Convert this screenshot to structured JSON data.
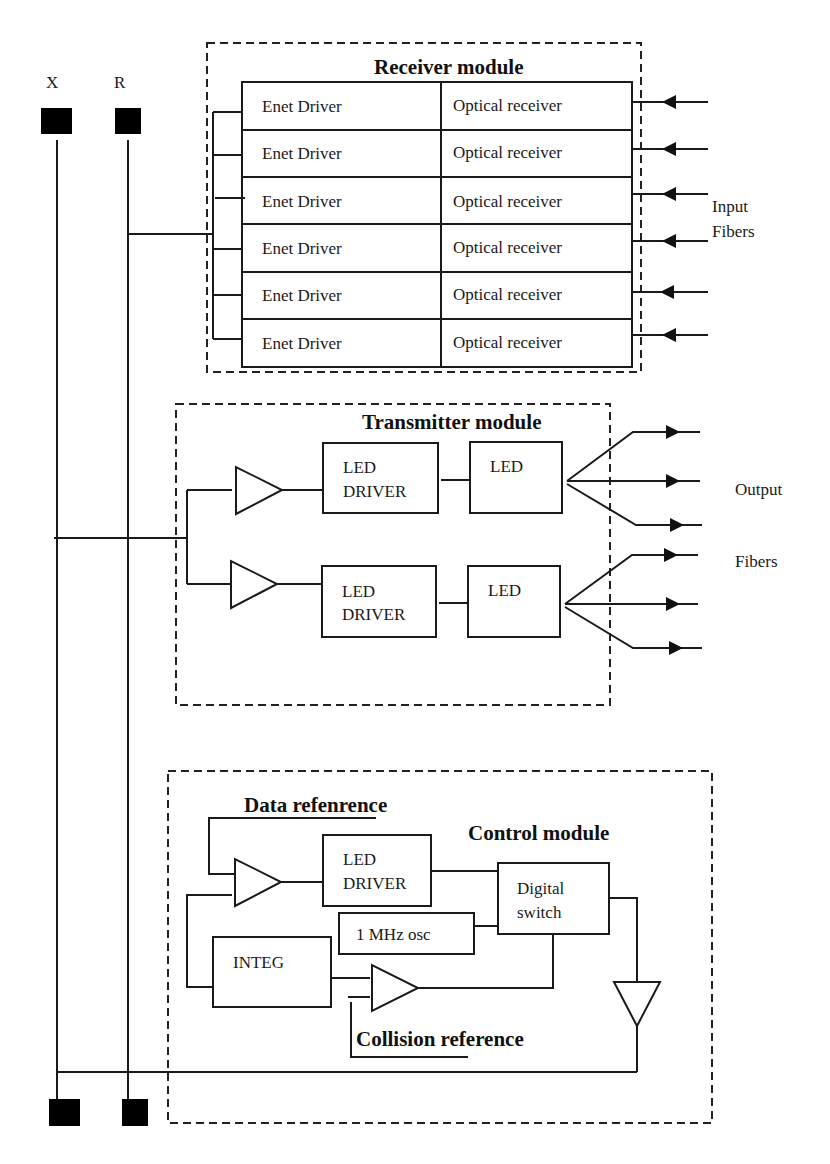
{
  "bus": {
    "top_labels": [
      "X",
      "R"
    ]
  },
  "receiver": {
    "title": "Receiver module",
    "rows": [
      {
        "driver": "Enet  Driver",
        "receiver": "Optical receiver"
      },
      {
        "driver": "Enet  Driver",
        "receiver": "Optical receiver"
      },
      {
        "driver": "Enet  Driver",
        "receiver": "Optical receiver"
      },
      {
        "driver": "Enet  Driver",
        "receiver": "Optical receiver"
      },
      {
        "driver": "Enet  Driver",
        "receiver": "Optical receiver"
      },
      {
        "driver": "Enet  Driver",
        "receiver": "Optical receiver"
      }
    ],
    "fiber_label_1": "Input",
    "fiber_label_2": "Fibers"
  },
  "transmitter": {
    "title": "Transmitter module",
    "driver_line1": "LED",
    "driver_line2": "DRIVER",
    "led_label": "LED",
    "fiber_label_1": "Output",
    "fiber_label_2": "Fibers"
  },
  "control": {
    "title": "Control module",
    "data_reference": "Data refenrence",
    "collision_reference": "Collision reference",
    "driver_line1": "LED",
    "driver_line2": "DRIVER",
    "switch_line1": "Digital",
    "switch_line2": "switch",
    "osc_label": "1 MHz osc",
    "integ_label": "INTEG"
  }
}
